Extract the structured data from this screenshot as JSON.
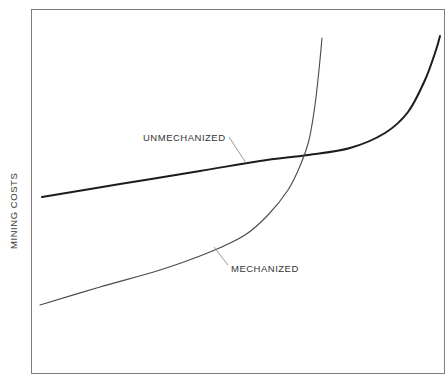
{
  "chart_data": {
    "type": "line",
    "title": "",
    "subtitle": "",
    "xlabel": "",
    "ylabel": "MINING COSTS",
    "grid": false,
    "legend_position": "inline-annotations",
    "axis_ticks": {
      "x": [],
      "y": []
    },
    "xlim": [
      0,
      100
    ],
    "ylim": [
      0,
      100
    ],
    "annotations": [
      {
        "text": "UNMECHANIZED",
        "series": "unmechanized",
        "label_x": 143,
        "label_y": 141,
        "leader_from_x": 229,
        "leader_from_y": 137,
        "leader_to_x": 246,
        "leader_to_y": 163
      },
      {
        "text": "MECHANIZED",
        "series": "mechanized",
        "label_x": 231,
        "label_y": 272,
        "leader_from_x": 228,
        "leader_from_y": 265,
        "leader_to_x": 214,
        "leader_to_y": 247
      }
    ],
    "series": [
      {
        "name": "UNMECHANIZED",
        "description": "High initial cost, gently rising, then sharply increasing at the far right",
        "stroke": "#1c1c1c",
        "stroke_width": 2.0,
        "points_px": [
          [
            42,
            197
          ],
          [
            120,
            184
          ],
          [
            200,
            171
          ],
          [
            260,
            161
          ],
          [
            308,
            155
          ],
          [
            350,
            148
          ],
          [
            385,
            133
          ],
          [
            408,
            112
          ],
          [
            425,
            80
          ],
          [
            436,
            50
          ],
          [
            440,
            36
          ]
        ]
      },
      {
        "name": "MECHANIZED",
        "description": "Low initial cost, rising gradually, then increasing near-vertically past the crossover",
        "stroke": "#4a4a4a",
        "stroke_width": 1.1,
        "points_px": [
          [
            40,
            305
          ],
          [
            100,
            287
          ],
          [
            160,
            270
          ],
          [
            210,
            252
          ],
          [
            245,
            235
          ],
          [
            268,
            215
          ],
          [
            288,
            190
          ],
          [
            300,
            166
          ],
          [
            309,
            140
          ],
          [
            315,
            105
          ],
          [
            319,
            70
          ],
          [
            322,
            38
          ]
        ]
      }
    ],
    "crossover_point_px": [
      308,
      155
    ],
    "plot_frame_px": {
      "left": 31,
      "top": 9,
      "right": 444,
      "bottom": 373,
      "border_color": "#7d7d7d",
      "border_width": 1
    },
    "background_color": "#ffffff"
  },
  "figure": {
    "y_axis_label": "MINING COSTS",
    "unmechanized_label": "UNMECHANIZED",
    "mechanized_label": "MECHANIZED"
  }
}
